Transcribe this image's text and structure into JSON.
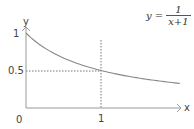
{
  "chart_data": {
    "type": "line",
    "title": "",
    "function": "y = 1/(x+1)",
    "xlabel": "x",
    "ylabel": "y",
    "xlim": [
      0,
      2.1
    ],
    "ylim": [
      0,
      1.05
    ],
    "x_ticks": [
      "0",
      "1"
    ],
    "y_ticks": [
      "0.5",
      "1"
    ],
    "grid": false,
    "series": [
      {
        "name": "y = 1/(x+1)",
        "x": [
          0,
          0.25,
          0.5,
          0.75,
          1,
          1.25,
          1.5,
          1.75,
          2.05
        ],
        "values": [
          1,
          0.8,
          0.667,
          0.571,
          0.5,
          0.444,
          0.4,
          0.364,
          0.328
        ]
      }
    ],
    "annotations": [
      {
        "type": "dashed-vertical",
        "x": 1,
        "from_y": 0,
        "to_y": 1.0
      },
      {
        "type": "dashed-horizontal",
        "y": 0.5,
        "from_x": 0,
        "to_x": 1
      },
      {
        "type": "formula",
        "text": "y = 1/(x+1)",
        "position": "top-right"
      }
    ],
    "colors": {
      "curve": "#888888",
      "axes": "#999999",
      "guides": "#666666"
    }
  },
  "labels": {
    "y_axis": "y",
    "x_axis": "x",
    "origin": "0",
    "y_one": "1",
    "y_half": "0.5",
    "x_one": "1"
  },
  "formula": {
    "lhs": "y =",
    "numerator": "1",
    "denominator": "x+1"
  }
}
